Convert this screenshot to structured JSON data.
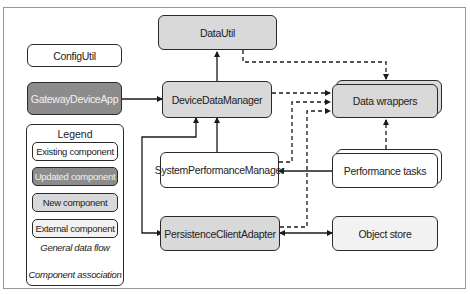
{
  "diagram": {
    "components": {
      "config_util": {
        "label": "ConfigUtil",
        "type": "existing"
      },
      "gateway_device_app": {
        "label": "GatewayDeviceApp",
        "type": "updated"
      },
      "data_util": {
        "label": "DataUtil",
        "type": "new"
      },
      "device_data_manager": {
        "label": "DeviceDataManager",
        "type": "new"
      },
      "data_wrappers": {
        "label": "Data wrappers",
        "type": "new",
        "stacked": true
      },
      "system_performance_manager": {
        "label": "SystemPerformanceManager",
        "type": "existing"
      },
      "performance_tasks": {
        "label": "Performance tasks",
        "type": "existing",
        "stacked": true
      },
      "persistence_client_adapter": {
        "label": "PersistenceClientAdapter",
        "type": "new"
      },
      "object_store": {
        "label": "Object store",
        "type": "external"
      }
    },
    "connections": [
      {
        "from": "GatewayDeviceApp",
        "to": "DeviceDataManager",
        "style": "solid"
      },
      {
        "from": "DeviceDataManager",
        "to": "DataUtil",
        "style": "solid"
      },
      {
        "from": "SystemPerformanceManager",
        "to": "DeviceDataManager",
        "style": "solid"
      },
      {
        "from": "DeviceDataManager",
        "to": "PersistenceClientAdapter",
        "style": "solid",
        "bidirectional": true
      },
      {
        "from": "Performance tasks",
        "to": "SystemPerformanceManager",
        "style": "solid"
      },
      {
        "from": "PersistenceClientAdapter",
        "to": "Object store",
        "style": "solid",
        "bidirectional": true
      },
      {
        "from": "DataUtil",
        "to": "Data wrappers",
        "style": "dashed"
      },
      {
        "from": "DeviceDataManager",
        "to": "Data wrappers",
        "style": "dashed"
      },
      {
        "from": "SystemPerformanceManager",
        "to": "Data wrappers",
        "style": "dashed"
      },
      {
        "from": "PersistenceClientAdapter",
        "to": "Data wrappers",
        "style": "dashed"
      },
      {
        "from": "Performance tasks",
        "to": "Data wrappers",
        "style": "dashed"
      }
    ],
    "legend": {
      "title": "Legend",
      "items": [
        {
          "label": "Existing component",
          "type": "existing"
        },
        {
          "label": "Updated component",
          "type": "updated"
        },
        {
          "label": "New component",
          "type": "new"
        },
        {
          "label": "External component",
          "type": "external"
        }
      ],
      "general_data_flow": "General data flow",
      "component_association": "Component association"
    },
    "colors": {
      "existing": "#ffffff",
      "updated": "#8c8c8c",
      "new": "#d9d9d9",
      "external": "#f2f2f2",
      "line": "#2a2a2a"
    }
  }
}
